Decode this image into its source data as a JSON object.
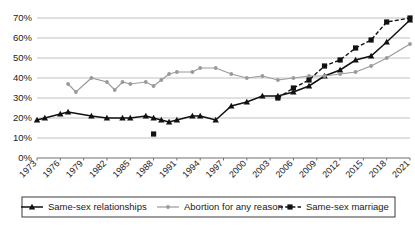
{
  "chart_data": {
    "type": "line",
    "title": "",
    "subtitle": "",
    "xlabel": "",
    "ylabel": "",
    "grid": true,
    "legend_position": "bottom",
    "ylim": [
      0,
      70
    ],
    "ytick_labels": [
      "0%",
      "10%",
      "20%",
      "30%",
      "40%",
      "50%",
      "60%",
      "70%"
    ],
    "ytick_values": [
      0,
      10,
      20,
      30,
      40,
      50,
      60,
      70
    ],
    "x": [
      1973,
      1974,
      1975,
      1976,
      1977,
      1978,
      1979,
      1980,
      1981,
      1982,
      1983,
      1984,
      1985,
      1986,
      1987,
      1988,
      1989,
      1990,
      1991,
      1992,
      1993,
      1994,
      1995,
      1996,
      1997,
      1998,
      1999,
      2000,
      2001,
      2002,
      2003,
      2004,
      2005,
      2006,
      2007,
      2008,
      2009,
      2010,
      2011,
      2012,
      2013,
      2014,
      2015,
      2016,
      2017,
      2018,
      2019,
      2020,
      2021
    ],
    "xtick_labels": [
      "1973",
      "1976",
      "1979",
      "1982",
      "1985",
      "1988",
      "1991",
      "1994",
      "1997",
      "2000",
      "2003",
      "2006",
      "2009",
      "2012",
      "2015",
      "2018",
      "2021"
    ],
    "xtick_values": [
      1973,
      1976,
      1979,
      1982,
      1985,
      1988,
      1991,
      1994,
      1997,
      2000,
      2003,
      2006,
      2009,
      2012,
      2015,
      2018,
      2021
    ],
    "series": [
      {
        "name": "Same-sex relationships",
        "marker": "triangle",
        "color": "#111111",
        "style": "solid",
        "points": [
          {
            "x": 1973,
            "y": 19
          },
          {
            "x": 1974,
            "y": 20
          },
          {
            "x": 1976,
            "y": 22
          },
          {
            "x": 1977,
            "y": 23
          },
          {
            "x": 1980,
            "y": 21
          },
          {
            "x": 1982,
            "y": 20
          },
          {
            "x": 1984,
            "y": 20
          },
          {
            "x": 1985,
            "y": 20
          },
          {
            "x": 1987,
            "y": 21
          },
          {
            "x": 1988,
            "y": 20
          },
          {
            "x": 1989,
            "y": 19
          },
          {
            "x": 1990,
            "y": 18
          },
          {
            "x": 1991,
            "y": 19
          },
          {
            "x": 1993,
            "y": 21
          },
          {
            "x": 1994,
            "y": 21
          },
          {
            "x": 1996,
            "y": 19
          },
          {
            "x": 1998,
            "y": 26
          },
          {
            "x": 2000,
            "y": 28
          },
          {
            "x": 2002,
            "y": 31
          },
          {
            "x": 2004,
            "y": 31
          },
          {
            "x": 2006,
            "y": 33
          },
          {
            "x": 2008,
            "y": 36
          },
          {
            "x": 2010,
            "y": 41
          },
          {
            "x": 2012,
            "y": 44
          },
          {
            "x": 2014,
            "y": 49
          },
          {
            "x": 2016,
            "y": 51
          },
          {
            "x": 2018,
            "y": 58
          },
          {
            "x": 2021,
            "y": 69
          }
        ]
      },
      {
        "name": "Abortion for any reason",
        "marker": "circle",
        "color": "#9a9a9a",
        "style": "solid",
        "points": [
          {
            "x": 1977,
            "y": 37
          },
          {
            "x": 1978,
            "y": 33
          },
          {
            "x": 1980,
            "y": 40
          },
          {
            "x": 1982,
            "y": 38
          },
          {
            "x": 1983,
            "y": 34
          },
          {
            "x": 1984,
            "y": 38
          },
          {
            "x": 1985,
            "y": 37
          },
          {
            "x": 1987,
            "y": 38
          },
          {
            "x": 1988,
            "y": 36
          },
          {
            "x": 1989,
            "y": 39
          },
          {
            "x": 1990,
            "y": 42
          },
          {
            "x": 1991,
            "y": 43
          },
          {
            "x": 1993,
            "y": 43
          },
          {
            "x": 1994,
            "y": 45
          },
          {
            "x": 1996,
            "y": 45
          },
          {
            "x": 1998,
            "y": 42
          },
          {
            "x": 2000,
            "y": 40
          },
          {
            "x": 2002,
            "y": 41
          },
          {
            "x": 2004,
            "y": 39
          },
          {
            "x": 2006,
            "y": 40
          },
          {
            "x": 2008,
            "y": 41
          },
          {
            "x": 2010,
            "y": 41
          },
          {
            "x": 2012,
            "y": 42
          },
          {
            "x": 2014,
            "y": 43
          },
          {
            "x": 2016,
            "y": 46
          },
          {
            "x": 2018,
            "y": 50
          },
          {
            "x": 2021,
            "y": 57
          }
        ]
      },
      {
        "name": "Same-sex marriage",
        "marker": "square",
        "color": "#111111",
        "style": "dashed",
        "points": [
          {
            "x": 1988,
            "y": 12
          },
          {
            "x": 2004,
            "y": 30
          },
          {
            "x": 2006,
            "y": 35
          },
          {
            "x": 2008,
            "y": 39
          },
          {
            "x": 2010,
            "y": 46
          },
          {
            "x": 2012,
            "y": 49
          },
          {
            "x": 2014,
            "y": 55
          },
          {
            "x": 2016,
            "y": 59
          },
          {
            "x": 2018,
            "y": 68
          },
          {
            "x": 2021,
            "y": 70
          }
        ],
        "segments": [
          [
            0
          ],
          [
            1,
            2,
            3,
            4,
            5,
            6,
            7,
            8,
            9
          ]
        ]
      }
    ]
  },
  "legend": {
    "items": [
      {
        "label": "Same-sex relationships",
        "marker": "triangle",
        "color": "#111111",
        "style": "solid"
      },
      {
        "label": "Abortion for any reason",
        "marker": "circle",
        "color": "#9a9a9a",
        "style": "solid"
      },
      {
        "label": "Same-sex marriage",
        "marker": "square",
        "color": "#111111",
        "style": "dashed"
      }
    ]
  }
}
